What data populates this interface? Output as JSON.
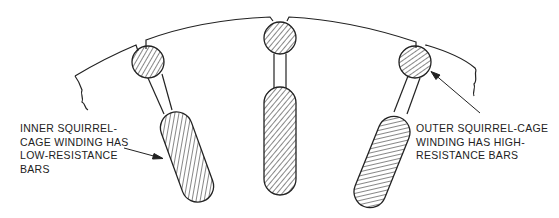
{
  "diagram": {
    "line_color": "#222222",
    "background": "#ffffff",
    "components": [
      {
        "id": "left-slot",
        "parts": [
          "outer-bar (circular)",
          "neck",
          "inner-bar (elongated)"
        ]
      },
      {
        "id": "center-slot",
        "parts": [
          "outer-bar (circular)",
          "neck",
          "inner-bar (elongated)"
        ]
      },
      {
        "id": "right-slot",
        "parts": [
          "outer-bar (circular)",
          "neck",
          "inner-bar (elongated)"
        ]
      }
    ]
  },
  "labels": {
    "inner": "INNER SQUIRREL-\nCAGE WINDING HAS\nLOW-RESISTANCE\nBARS",
    "outer": "OUTER SQUIRREL-CAGE\nWINDING HAS HIGH-\nRESISTANCE BARS"
  }
}
